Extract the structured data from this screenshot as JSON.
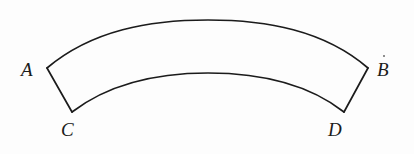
{
  "figure": {
    "kind": "geometry-diagram",
    "shape_name": "annular-sector",
    "background_color": "#fdfdfd",
    "stroke_color": "#1b1b1b",
    "stroke_width": 1.6,
    "fill_color": "none",
    "canvas": {
      "width": 414,
      "height": 154
    },
    "labels": [
      {
        "id": "A",
        "text": "A",
        "x": 21,
        "y": 60,
        "vertex_x": 47,
        "vertex_y": 68,
        "corner": "outer-left"
      },
      {
        "id": "B",
        "text": "B",
        "x": 377,
        "y": 60,
        "vertex_x": 368,
        "vertex_y": 68,
        "corner": "outer-right"
      },
      {
        "id": "C",
        "text": "C",
        "x": 61,
        "y": 120,
        "vertex_x": 72,
        "vertex_y": 112,
        "corner": "inner-left"
      },
      {
        "id": "D",
        "text": "D",
        "x": 328,
        "y": 120,
        "vertex_x": 344,
        "vertex_y": 112,
        "corner": "inner-right"
      }
    ],
    "geometry": {
      "outer_arc": {
        "start_x": 47,
        "start_y": 68,
        "apex_x": 208,
        "apex_y": 20,
        "end_x": 368,
        "end_y": 68
      },
      "inner_arc": {
        "start_x": 72,
        "start_y": 112,
        "apex_x": 208,
        "apex_y": 73,
        "end_x": 344,
        "end_y": 112
      },
      "left_edge": {
        "x1": 47,
        "y1": 68,
        "x2": 72,
        "y2": 112
      },
      "right_edge": {
        "x1": 368,
        "y1": 68,
        "x2": 344,
        "y2": 112
      }
    },
    "artifacts": [
      {
        "id": "speck-above-b",
        "x": 383,
        "y": 55,
        "color": "#3a3a3a"
      }
    ]
  }
}
